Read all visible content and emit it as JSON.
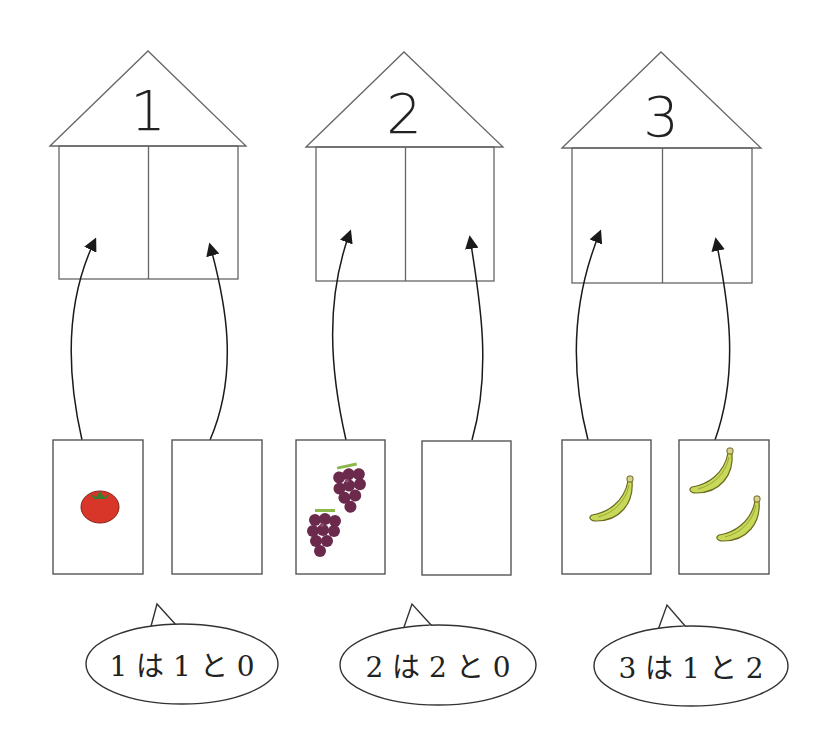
{
  "houses": [
    {
      "number": "1",
      "roof_label": "1",
      "left_card_fruit": "tomato",
      "left_count": 1,
      "right_count": 0,
      "statement": "1は1と0"
    },
    {
      "number": "2",
      "roof_label": "2",
      "left_card_fruit": "grape",
      "left_count": 2,
      "right_count": 0,
      "statement": "2は2と0"
    },
    {
      "number": "3",
      "roof_label": "3",
      "left_card_fruit": "banana",
      "left_count": 1,
      "right_count": 2,
      "statement": "3は1と2"
    }
  ],
  "bubbles": {
    "b1": "1 は 1 と 0",
    "b2": "2 は 2 と 0",
    "b3": "3 は 1 と 2"
  },
  "colors": {
    "line": "#555555",
    "arrow": "#1a1a1a",
    "tomato": "#d9362a",
    "tomato_leaf": "#3d7a2e",
    "grape": "#6b2a4c",
    "grape_stem": "#8cb84a",
    "banana": "#c8d858",
    "banana_edge": "#6a6a20"
  }
}
